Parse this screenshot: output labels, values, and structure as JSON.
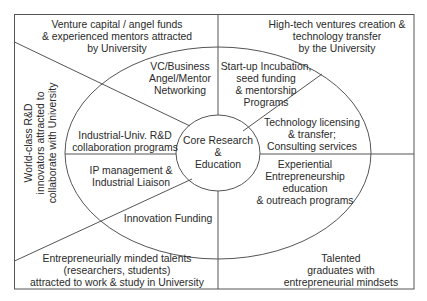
{
  "diagram": {
    "stroke_color": "#555555",
    "text_color": "#2a2a2a",
    "center": {
      "label": "Core Research\n&\nEducation"
    },
    "inner_segments": [
      {
        "id": "vc-networking",
        "label": "VC/Business\nAngel/Mentor\nNetworking"
      },
      {
        "id": "startup-incubation",
        "label": "Start-up Incubation,\nseed funding\n& mentorship\nPrograms"
      },
      {
        "id": "tech-licensing",
        "label": "Technology licensing\n& transfer;\nConsulting services"
      },
      {
        "id": "experiential-education",
        "label": "Experiential\nEntrepreneurship\neducation\n& outreach programs"
      },
      {
        "id": "innovation-funding",
        "label": "Innovation Funding"
      },
      {
        "id": "ip-management",
        "label": "IP management &\nIndustrial Liaison"
      },
      {
        "id": "industrial-collab",
        "label": "Industrial-Univ. R&D\ncollaboration programs"
      }
    ],
    "outer_regions": [
      {
        "id": "venture-capital",
        "label": "Venture capital / angel funds\n& experienced mentors attracted\nby University"
      },
      {
        "id": "hightech-ventures",
        "label": "High-tech ventures creation &\ntechnology transfer\nby the University"
      },
      {
        "id": "world-class-rd",
        "label": "World-class R&D\ninnovators attracted to\ncollaborate with University"
      },
      {
        "id": "entrepreneurial-talents",
        "label": "Entrepreneurially minded talents\n(researchers, students)\nattracted to work & study in University"
      },
      {
        "id": "talented-graduates",
        "label": "Talented\ngraduates with\nentrepreneurial mindsets"
      }
    ]
  }
}
